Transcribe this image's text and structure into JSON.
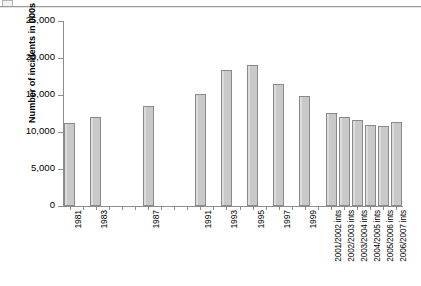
{
  "figure": {
    "top_rule": true,
    "corner_mark_icon": "page-corner-icon"
  },
  "chart_data": {
    "type": "bar",
    "title": "",
    "xlabel": "",
    "ylabel": "Number of incidents in 000s",
    "ylim": [
      0,
      25000
    ],
    "yticks": [
      0,
      5000,
      10000,
      15000,
      20000,
      25000
    ],
    "ytick_labels": [
      "0",
      "5,000",
      "10,000",
      "15,000",
      "20,000",
      "25,000"
    ],
    "grid": false,
    "legend": null,
    "bar_color": "#c9c9c9",
    "bar_edge_color": "#8a8a8a",
    "axis_color": "#8d8d8d",
    "categories": [
      "1981",
      "1982",
      "1983",
      "1984",
      "1985",
      "1986",
      "1987",
      "1988",
      "1989",
      "1990",
      "1991",
      "1992",
      "1993",
      "1994",
      "1995",
      "1996",
      "1997",
      "1998",
      "1999",
      "2000",
      "2001/2002 ints",
      "2002/2003 ints",
      "2003/2004 ints",
      "2004/2005 ints",
      "2005/2006 ints",
      "2006/2007 ints"
    ],
    "tick_labels_shown": [
      "1981",
      "1983",
      "1987",
      "1991",
      "1993",
      "1995",
      "1997",
      "1999",
      "2001/2002 ints",
      "2002/2003 ints",
      "2003/2004 ints",
      "2004/2005 ints",
      "2005/2006 ints",
      "2006/2007 ints"
    ],
    "values": [
      11200,
      null,
      12000,
      null,
      null,
      null,
      13500,
      null,
      null,
      null,
      15100,
      null,
      18400,
      null,
      19100,
      null,
      16500,
      null,
      14900,
      null,
      12600,
      12000,
      11600,
      10900,
      10800,
      11300
    ]
  }
}
